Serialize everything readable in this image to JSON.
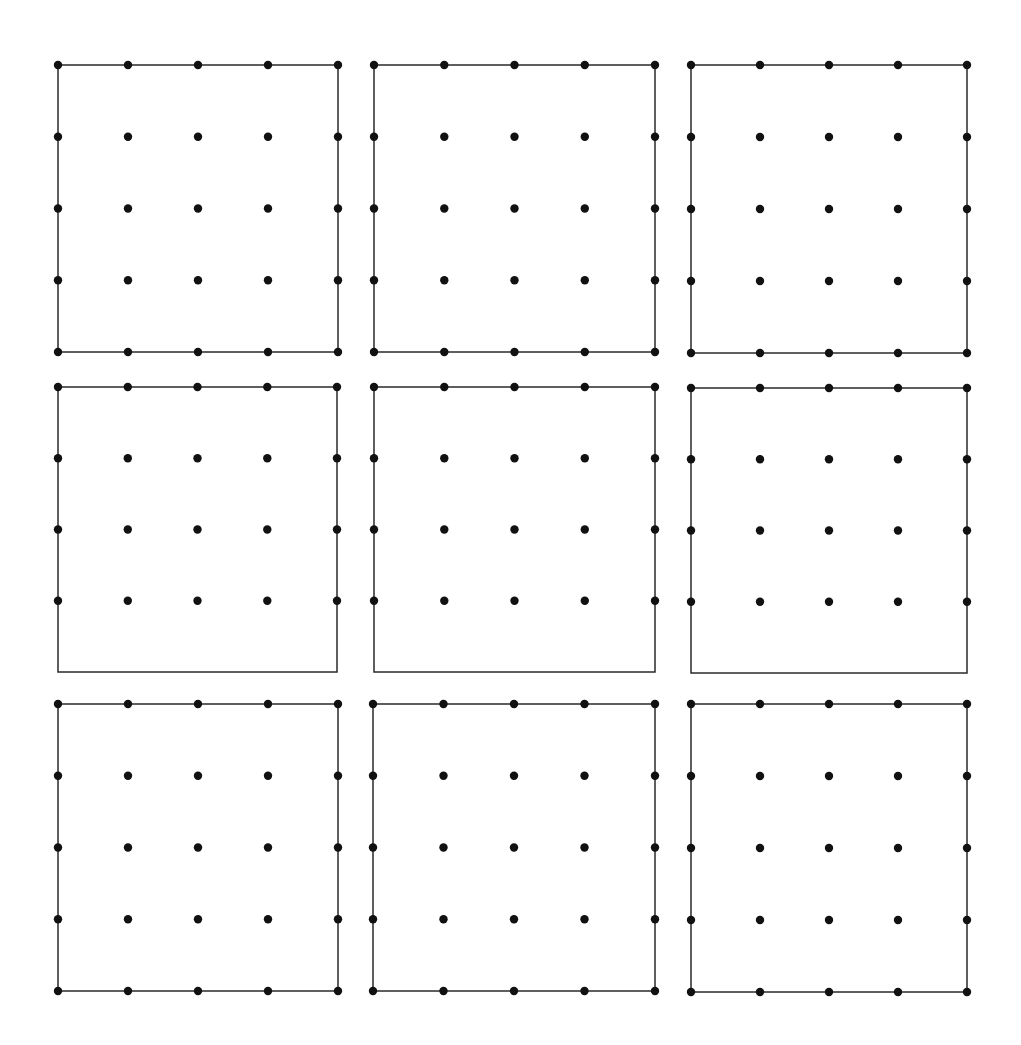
{
  "colors": {
    "background": "#ffffff",
    "ink": "#111111",
    "line": "#2a2a2a"
  },
  "grid": {
    "rows": 3,
    "cols": 3,
    "dots_per_side": 5
  },
  "panels": [
    {
      "id": "r1c1",
      "x": 58,
      "y": 65,
      "w": 280,
      "h": 287,
      "bottom_dots": true
    },
    {
      "id": "r1c2",
      "x": 374,
      "y": 65,
      "w": 281,
      "h": 287,
      "bottom_dots": true
    },
    {
      "id": "r1c3",
      "x": 691,
      "y": 65,
      "w": 276,
      "h": 288,
      "bottom_dots": true
    },
    {
      "id": "r2c1",
      "x": 58,
      "y": 387,
      "w": 279,
      "h": 285,
      "bottom_dots": false,
      "dot_rows": 4
    },
    {
      "id": "r2c2",
      "x": 374,
      "y": 387,
      "w": 281,
      "h": 285,
      "bottom_dots": false,
      "dot_rows": 4
    },
    {
      "id": "r2c3",
      "x": 691,
      "y": 388,
      "w": 276,
      "h": 285,
      "bottom_dots": false,
      "dot_rows": 4
    },
    {
      "id": "r3c1",
      "x": 58,
      "y": 704,
      "w": 280,
      "h": 287,
      "bottom_dots": true
    },
    {
      "id": "r3c2",
      "x": 373,
      "y": 704,
      "w": 282,
      "h": 287,
      "bottom_dots": true
    },
    {
      "id": "r3c3",
      "x": 691,
      "y": 704,
      "w": 276,
      "h": 288,
      "bottom_dots": true
    }
  ]
}
